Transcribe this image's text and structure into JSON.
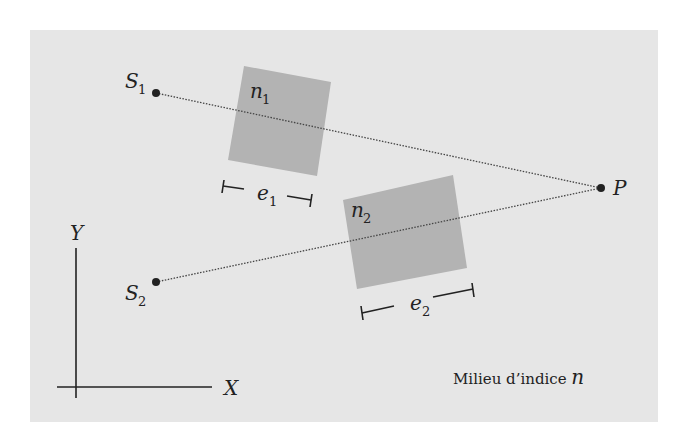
{
  "figure": {
    "background": "#e6e6e6",
    "medium_color": "#b3b3b3",
    "line_color": "#333333",
    "sources": [
      {
        "name": "S",
        "sub": "1"
      },
      {
        "name": "S",
        "sub": "2"
      }
    ],
    "point": {
      "name": "P"
    },
    "media": [
      {
        "index": "n",
        "sub": "1",
        "thickness": "e",
        "thickness_sub": "1"
      },
      {
        "index": "n",
        "sub": "2",
        "thickness": "e",
        "thickness_sub": "2"
      }
    ],
    "axes": {
      "x": "X",
      "y": "Y"
    },
    "caption": {
      "text": "Milieu d’indice ",
      "symbol": "n"
    }
  }
}
